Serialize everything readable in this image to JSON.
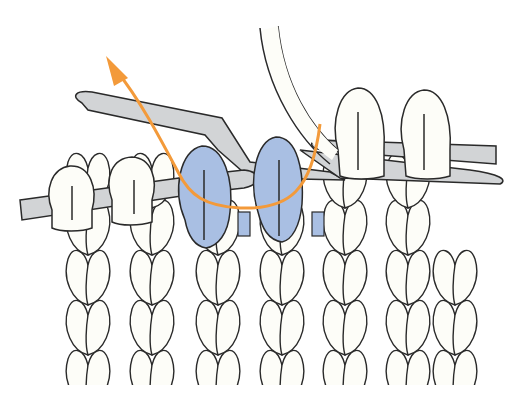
{
  "figure": {
    "title": "Knitting technique: slipped stitches passed back over worked stitch",
    "colors": {
      "background": "#ffffff",
      "yarn": "#fdfdf8",
      "highlight_stitch": "#a9bfe3",
      "needle": "#d2d4d6",
      "outline": "#2a2a2a",
      "arrow": "#f39a3a"
    },
    "elements": {
      "left_needle": "horizontal needle at left holding stitches",
      "right_needle": "needle tip inserted through highlighted stitches",
      "cable_needle": "bent needle passing through highlighted loops",
      "highlighted_stitches": 2,
      "arrow_direction": "up-left",
      "fabric": "stockinette stitch rows"
    }
  }
}
